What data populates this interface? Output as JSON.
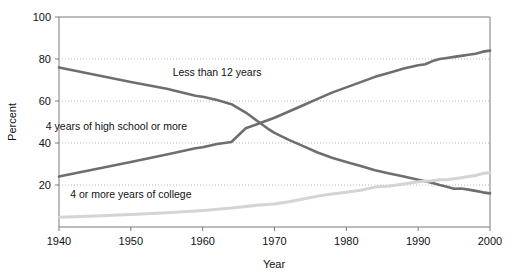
{
  "chart_data": {
    "type": "line",
    "title": "",
    "subtitle": "",
    "xlabel": "Year",
    "ylabel": "Percent",
    "xlim": [
      1940,
      2000
    ],
    "ylim": [
      0,
      100
    ],
    "xticks": [
      1940,
      1950,
      1960,
      1970,
      1980,
      1990,
      2000
    ],
    "xtick_labels": [
      "1940",
      "1950",
      "1960",
      "1970",
      "1980",
      "1990",
      "2000"
    ],
    "yticks": [
      20,
      40,
      60,
      80,
      100
    ],
    "ytick_labels": [
      "20",
      "40",
      "60",
      "80",
      "100"
    ],
    "grid": "horizontal-dotted",
    "legend_position": "inline-annotations",
    "series": [
      {
        "name": "Less than 12 years",
        "color": "#6e6e6e",
        "label_x": 1962,
        "label_y": 72,
        "x": [
          1940,
          1945,
          1950,
          1955,
          1959,
          1960,
          1962,
          1964,
          1965,
          1966,
          1967,
          1968,
          1969,
          1970,
          1972,
          1974,
          1976,
          1978,
          1980,
          1982,
          1984,
          1986,
          1988,
          1990,
          1991,
          1992,
          1993,
          1994,
          1995,
          1996,
          1997,
          1998,
          1999,
          2000
        ],
        "values": [
          76.0,
          72.5,
          69.0,
          65.8,
          62.5,
          62.0,
          60.5,
          58.5,
          56.5,
          54.5,
          52.0,
          49.5,
          47.0,
          44.8,
          41.5,
          38.5,
          35.5,
          33.0,
          31.0,
          29.0,
          27.0,
          25.5,
          24.0,
          22.5,
          21.8,
          21.0,
          20.0,
          19.2,
          18.2,
          18.3,
          17.8,
          17.2,
          16.5,
          16.0
        ]
      },
      {
        "name": "4 years of high school or more",
        "color": "#6e6e6e",
        "label_x": 1948,
        "label_y": 46,
        "x": [
          1940,
          1945,
          1950,
          1955,
          1959,
          1960,
          1962,
          1964,
          1966,
          1968,
          1970,
          1972,
          1974,
          1976,
          1978,
          1980,
          1982,
          1984,
          1986,
          1988,
          1990,
          1991,
          1992,
          1993,
          1994,
          1995,
          1996,
          1997,
          1998,
          1999,
          2000
        ],
        "values": [
          24.0,
          27.5,
          31.0,
          34.5,
          37.5,
          38.0,
          39.5,
          40.5,
          47.0,
          49.5,
          52.0,
          55.0,
          58.0,
          61.0,
          64.0,
          66.5,
          69.0,
          71.5,
          73.5,
          75.5,
          77.0,
          77.5,
          79.0,
          80.0,
          80.5,
          81.0,
          81.5,
          82.0,
          82.5,
          83.5,
          84.0
        ]
      },
      {
        "name": "4 or more years of college",
        "color": "#d4d4d4",
        "label_x": 1950,
        "label_y": 14,
        "x": [
          1940,
          1945,
          1950,
          1955,
          1959,
          1960,
          1962,
          1964,
          1966,
          1968,
          1970,
          1972,
          1974,
          1976,
          1978,
          1980,
          1982,
          1984,
          1986,
          1988,
          1990,
          1991,
          1992,
          1993,
          1994,
          1995,
          1996,
          1997,
          1998,
          1999,
          2000
        ],
        "values": [
          4.6,
          5.2,
          6.0,
          6.8,
          7.6,
          7.8,
          8.4,
          9.0,
          9.8,
          10.5,
          11.0,
          12.0,
          13.3,
          14.7,
          15.7,
          16.5,
          17.5,
          19.0,
          19.5,
          20.5,
          21.5,
          21.8,
          22.0,
          22.5,
          22.5,
          23.0,
          23.5,
          24.0,
          24.5,
          25.5,
          26.0
        ]
      }
    ]
  }
}
